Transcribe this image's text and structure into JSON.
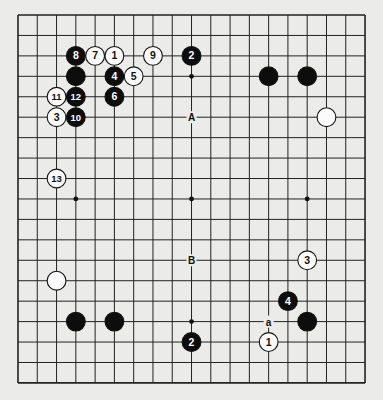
{
  "board": {
    "size": 19,
    "origin_x": 18,
    "origin_y": 15,
    "step_x": 19.28,
    "step_y": 20.44,
    "background": "#ebebea",
    "line_color": "#222222",
    "star_points": [
      [
        3,
        9
      ],
      [
        9,
        3
      ],
      [
        9,
        9
      ],
      [
        15,
        9
      ],
      [
        9,
        15
      ]
    ]
  },
  "stones": [
    {
      "color": "black",
      "col": 3,
      "row": 2,
      "label": "8"
    },
    {
      "color": "white",
      "col": 4,
      "row": 2,
      "label": "7"
    },
    {
      "color": "white",
      "col": 5,
      "row": 2,
      "label": "1"
    },
    {
      "color": "white",
      "col": 7,
      "row": 2,
      "label": "9"
    },
    {
      "color": "black",
      "col": 9,
      "row": 2,
      "label": "2"
    },
    {
      "color": "black",
      "col": 3,
      "row": 3,
      "label": ""
    },
    {
      "color": "black",
      "col": 5,
      "row": 3,
      "label": "4"
    },
    {
      "color": "white",
      "col": 6,
      "row": 3,
      "label": "5"
    },
    {
      "color": "black",
      "col": 13,
      "row": 3,
      "label": ""
    },
    {
      "color": "black",
      "col": 15,
      "row": 3,
      "label": ""
    },
    {
      "color": "white",
      "col": 2,
      "row": 4,
      "label": "11"
    },
    {
      "color": "black",
      "col": 3,
      "row": 4,
      "label": "12"
    },
    {
      "color": "black",
      "col": 5,
      "row": 4,
      "label": "6"
    },
    {
      "color": "white",
      "col": 2,
      "row": 5,
      "label": "3"
    },
    {
      "color": "black",
      "col": 3,
      "row": 5,
      "label": "10"
    },
    {
      "color": "white",
      "col": 16,
      "row": 5,
      "label": ""
    },
    {
      "color": "white",
      "col": 2,
      "row": 8,
      "label": "13"
    },
    {
      "color": "white",
      "col": 15,
      "row": 12,
      "label": "3"
    },
    {
      "color": "white",
      "col": 2,
      "row": 13,
      "label": ""
    },
    {
      "color": "black",
      "col": 14,
      "row": 14,
      "label": "4"
    },
    {
      "color": "black",
      "col": 3,
      "row": 15,
      "label": ""
    },
    {
      "color": "black",
      "col": 5,
      "row": 15,
      "label": ""
    },
    {
      "color": "black",
      "col": 15,
      "row": 15,
      "label": ""
    },
    {
      "color": "black",
      "col": 9,
      "row": 16,
      "label": "2"
    },
    {
      "color": "white",
      "col": 13,
      "row": 16,
      "label": "1"
    }
  ],
  "markers": [
    {
      "col": 9,
      "row": 5,
      "label": "A"
    },
    {
      "col": 9,
      "row": 12,
      "label": "B"
    },
    {
      "col": 13,
      "row": 15,
      "label": "a"
    }
  ]
}
